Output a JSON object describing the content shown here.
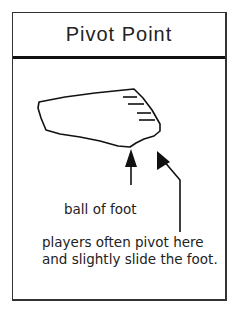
{
  "title": "Pivot Point",
  "labels": {
    "ball_of_foot": "ball of foot",
    "pivot_note": "players often pivot here and slightly slide the foot."
  },
  "figure": {
    "arrows": [
      {
        "target": "ball of foot",
        "direction": "up"
      },
      {
        "target": "pivot point at toe",
        "direction": "up-left"
      }
    ]
  }
}
